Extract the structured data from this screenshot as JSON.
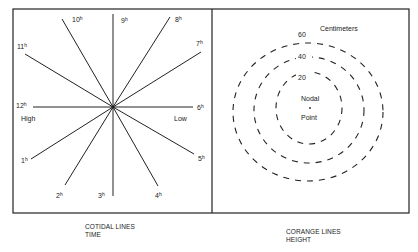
{
  "left_panel": {
    "title": "COTIDAL LINES",
    "subtitle": "TIME",
    "hours": [
      {
        "label": "1",
        "sup": "h"
      },
      {
        "label": "2",
        "sup": "h"
      },
      {
        "label": "3",
        "sup": "h"
      },
      {
        "label": "4",
        "sup": "h"
      },
      {
        "label": "5",
        "sup": "h"
      },
      {
        "label": "6",
        "sup": "h"
      },
      {
        "label": "7",
        "sup": "h"
      },
      {
        "label": "8",
        "sup": "h"
      },
      {
        "label": "9",
        "sup": "h"
      },
      {
        "label": "10",
        "sup": "h"
      },
      {
        "label": "11",
        "sup": "h"
      },
      {
        "label": "12",
        "sup": "h"
      }
    ],
    "high_label": "High",
    "low_label": "Low"
  },
  "right_panel": {
    "title": "CORANGE LINES",
    "subtitle": "HEIGHT",
    "unit_label": "Centimeters",
    "contours": [
      "20",
      "40",
      "60"
    ],
    "center_label_top": "Nodal",
    "center_label_bottom": "Point"
  },
  "colors": {
    "line": "#222222",
    "background": "#ffffff"
  }
}
